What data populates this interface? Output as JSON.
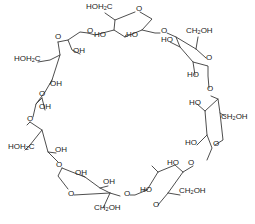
{
  "diagram": {
    "title": "",
    "labels": [
      {
        "id": "l1",
        "text": "HOH",
        "sub": "2",
        "tail": "C",
        "x": 86,
        "y": 7
      },
      {
        "id": "l2",
        "text": "O",
        "x": 136,
        "y": 9
      },
      {
        "id": "l3",
        "text": "O",
        "x": 87,
        "y": 31
      },
      {
        "id": "l4",
        "text": "HO",
        "x": 94,
        "y": 35
      },
      {
        "id": "l5",
        "text": "HO",
        "x": 126,
        "y": 35
      },
      {
        "id": "l6",
        "text": "O",
        "x": 161,
        "y": 31
      },
      {
        "id": "l7",
        "text": "HO",
        "x": 161,
        "y": 40
      },
      {
        "id": "l8",
        "text": "CH",
        "sub": "2",
        "tail": "OH",
        "x": 186,
        "y": 31
      },
      {
        "id": "l9",
        "text": "O",
        "x": 55,
        "y": 37
      },
      {
        "id": "l10",
        "text": "OH",
        "x": 73,
        "y": 51
      },
      {
        "id": "l11",
        "text": "HOH",
        "sub": "2",
        "tail": "C",
        "x": 14,
        "y": 59
      },
      {
        "id": "l12",
        "text": "O",
        "x": 206,
        "y": 58
      },
      {
        "id": "l13",
        "text": "HO",
        "x": 187,
        "y": 75
      },
      {
        "id": "l14",
        "text": "OH",
        "x": 50,
        "y": 84
      },
      {
        "id": "l15",
        "text": "O",
        "x": 39,
        "y": 94
      },
      {
        "id": "l16",
        "text": "O",
        "x": 207,
        "y": 89
      },
      {
        "id": "l17",
        "text": "OH",
        "x": 39,
        "y": 107
      },
      {
        "id": "l18",
        "text": "HO",
        "x": 189,
        "y": 103
      },
      {
        "id": "l19",
        "text": "CH",
        "sub": "2",
        "tail": "OH",
        "x": 221,
        "y": 117
      },
      {
        "id": "l20",
        "text": "O",
        "x": 27,
        "y": 119
      },
      {
        "id": "l21",
        "text": "HOH",
        "sub": "2",
        "tail": "C",
        "x": 8,
        "y": 147
      },
      {
        "id": "l22",
        "text": "OH",
        "x": 55,
        "y": 150
      },
      {
        "id": "l23",
        "text": "HO",
        "x": 185,
        "y": 143
      },
      {
        "id": "l24",
        "text": "O",
        "x": 213,
        "y": 144
      },
      {
        "id": "l25",
        "text": "O",
        "x": 56,
        "y": 165
      },
      {
        "id": "l26",
        "text": "OH",
        "x": 75,
        "y": 173
      },
      {
        "id": "l27",
        "text": "HO",
        "x": 167,
        "y": 163
      },
      {
        "id": "l28",
        "text": "O",
        "x": 188,
        "y": 163
      },
      {
        "id": "l29",
        "text": "OH",
        "x": 103,
        "y": 182
      },
      {
        "id": "l30",
        "text": "HO",
        "x": 140,
        "y": 190
      },
      {
        "id": "l31",
        "text": "O",
        "x": 68,
        "y": 194
      },
      {
        "id": "l32",
        "text": "O",
        "x": 124,
        "y": 194
      },
      {
        "id": "l33",
        "text": "CH",
        "sub": "2",
        "tail": "OH",
        "x": 179,
        "y": 191
      },
      {
        "id": "l34",
        "text": "CH",
        "sub": "2",
        "tail": "OH",
        "x": 94,
        "y": 208
      },
      {
        "id": "l35",
        "text": "O",
        "x": 153,
        "y": 205
      }
    ]
  }
}
